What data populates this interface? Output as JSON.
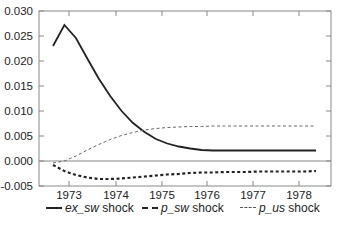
{
  "chart_data": {
    "type": "line",
    "title": "",
    "xlabel": "",
    "ylabel": "",
    "ylim": [
      -0.005,
      0.03
    ],
    "yticks": [
      "-0.005",
      "0.000",
      "0.005",
      "0.010",
      "0.015",
      "0.020",
      "0.025",
      "0.030"
    ],
    "ytick_values": [
      -0.005,
      0.0,
      0.005,
      0.01,
      0.015,
      0.02,
      0.025,
      0.03
    ],
    "xticks": [
      "1973",
      "1974",
      "1975",
      "1976",
      "1977",
      "1978"
    ],
    "x": [
      "1972Q3",
      "1972Q4",
      "1973Q1",
      "1973Q2",
      "1973Q3",
      "1973Q4",
      "1974Q1",
      "1974Q2",
      "1974Q3",
      "1974Q4",
      "1975Q1",
      "1975Q2",
      "1975Q3",
      "1975Q4",
      "1976Q1",
      "1976Q2",
      "1976Q3",
      "1976Q4",
      "1977Q1",
      "1977Q2",
      "1977Q3",
      "1977Q4",
      "1978Q1",
      "1978Q2"
    ],
    "grid": false,
    "zero_line": true,
    "legend_position": "bottom",
    "series": [
      {
        "name": "ex_sw shock",
        "style": "solid",
        "values": [
          0.023,
          0.0272,
          0.0246,
          0.0205,
          0.0165,
          0.013,
          0.01,
          0.0076,
          0.0058,
          0.0044,
          0.0035,
          0.0029,
          0.0025,
          0.0022,
          0.0021,
          0.0021,
          0.0021,
          0.0021,
          0.0021,
          0.0021,
          0.0021,
          0.0021,
          0.0021,
          0.0021
        ]
      },
      {
        "name": "p_sw shock",
        "style": "bold-dashed",
        "values": [
          -0.0008,
          -0.002,
          -0.0028,
          -0.0033,
          -0.0036,
          -0.0036,
          -0.0035,
          -0.0033,
          -0.0031,
          -0.0029,
          -0.0027,
          -0.0026,
          -0.0024,
          -0.0023,
          -0.0023,
          -0.0022,
          -0.0022,
          -0.0022,
          -0.0021,
          -0.0021,
          -0.0021,
          -0.0021,
          -0.0021,
          -0.002
        ]
      },
      {
        "name": "p_us shock",
        "style": "thin-dashed",
        "values": [
          -0.0004,
          0.0,
          0.001,
          0.0022,
          0.0033,
          0.0043,
          0.0051,
          0.0057,
          0.0062,
          0.0065,
          0.0067,
          0.0068,
          0.0069,
          0.0069,
          0.007,
          0.007,
          0.007,
          0.007,
          0.007,
          0.007,
          0.007,
          0.007,
          0.007,
          0.007
        ]
      }
    ]
  },
  "legend": {
    "items": [
      {
        "var": "ex_sw",
        "suffix": " shock"
      },
      {
        "var": "p_sw",
        "suffix": " shock"
      },
      {
        "var": "p_us",
        "suffix": " shock"
      }
    ]
  }
}
